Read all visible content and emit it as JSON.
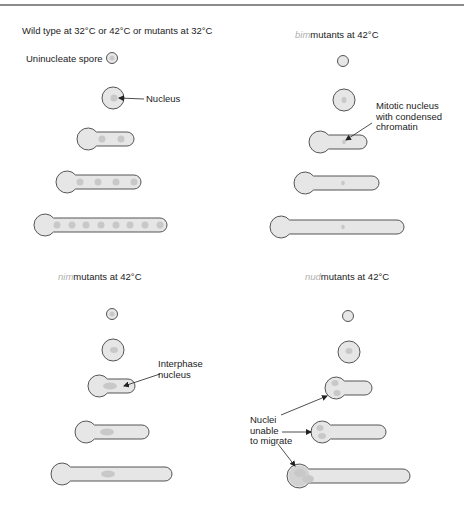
{
  "colors": {
    "outline": "#555555",
    "cell_fill": "#e6e6e6",
    "nucleus_fill": "#c8c8c8",
    "text": "#222222",
    "prefix_text": "#b0b0b0",
    "divider": "#666666"
  },
  "panels": [
    {
      "id": "wild-type",
      "title": {
        "prefix": "",
        "text": "Wild type at 32°C or 42°C or mutants at 32°C",
        "x": 22,
        "y": 34
      },
      "cells": [
        {
          "type": "spore",
          "cx": 112,
          "cy": 58,
          "r": 5.5,
          "nuclei": [
            {
              "cx": 112,
              "cy": 58,
              "rx": 2.5,
              "ry": 2.5
            }
          ]
        },
        {
          "type": "spore",
          "cx": 113,
          "cy": 98,
          "r": 11,
          "nuclei": [
            {
              "cx": 114,
              "cy": 98,
              "rx": 3.5,
              "ry": 3.5
            }
          ]
        },
        {
          "type": "hypha",
          "x1": 88,
          "x2": 134,
          "cy": 139,
          "r": 11,
          "tube": 7,
          "nuclei": [
            {
              "cx": 102,
              "cy": 139,
              "rx": 3.5,
              "ry": 3.5
            },
            {
              "cx": 121,
              "cy": 139,
              "rx": 3.5,
              "ry": 3.5
            }
          ]
        },
        {
          "type": "hypha",
          "x1": 67,
          "x2": 141,
          "cy": 182,
          "r": 11,
          "tube": 7,
          "nuclei": [
            {
              "cx": 80,
              "cy": 182,
              "rx": 3.5,
              "ry": 3.5
            },
            {
              "cx": 98,
              "cy": 182,
              "rx": 3.5,
              "ry": 3.5
            },
            {
              "cx": 116,
              "cy": 182,
              "rx": 3.5,
              "ry": 3.5
            },
            {
              "cx": 134,
              "cy": 182,
              "rx": 3.5,
              "ry": 3.5
            }
          ]
        },
        {
          "type": "hypha",
          "x1": 45,
          "x2": 167,
          "cy": 225,
          "r": 11,
          "tube": 7,
          "nuclei": [
            {
              "cx": 57,
              "cy": 225,
              "rx": 3.5,
              "ry": 3.5
            },
            {
              "cx": 72,
              "cy": 225,
              "rx": 3.5,
              "ry": 3.5
            },
            {
              "cx": 86,
              "cy": 225,
              "rx": 3.5,
              "ry": 3.5
            },
            {
              "cx": 101,
              "cy": 225,
              "rx": 3.5,
              "ry": 3.5
            },
            {
              "cx": 116,
              "cy": 225,
              "rx": 3.5,
              "ry": 3.5
            },
            {
              "cx": 130,
              "cy": 225,
              "rx": 3.5,
              "ry": 3.5
            },
            {
              "cx": 145,
              "cy": 225,
              "rx": 3.5,
              "ry": 3.5
            },
            {
              "cx": 160,
              "cy": 225,
              "rx": 3.5,
              "ry": 3.5
            }
          ]
        }
      ],
      "labels": [
        {
          "lines": [
            "Uninucleate spore"
          ],
          "x": 26,
          "y": 62
        },
        {
          "lines": [
            "Nucleus"
          ],
          "x": 146,
          "y": 102
        }
      ],
      "arrows": [
        {
          "x1": 144,
          "y1": 99,
          "x2": 119,
          "y2": 98
        }
      ]
    },
    {
      "id": "bim",
      "title": {
        "prefix": "bim",
        "text": "mutants at 42°C",
        "x": 295,
        "y": 38
      },
      "cells": [
        {
          "type": "spore",
          "cx": 343,
          "cy": 61,
          "r": 5.5,
          "nuclei": []
        },
        {
          "type": "spore",
          "cx": 344,
          "cy": 100,
          "r": 11,
          "nuclei": [
            {
              "cx": 344,
              "cy": 100,
              "rx": 2.5,
              "ry": 3
            }
          ]
        },
        {
          "type": "hypha",
          "x1": 320,
          "x2": 367,
          "cy": 142,
          "r": 11,
          "tube": 7,
          "nuclei": [
            {
              "cx": 344,
              "cy": 142,
              "rx": 1.8,
              "ry": 2.2
            }
          ]
        },
        {
          "type": "hypha",
          "x1": 305,
          "x2": 379,
          "cy": 183,
          "r": 11,
          "tube": 7,
          "nuclei": [
            {
              "cx": 343,
              "cy": 183,
              "rx": 1.8,
              "ry": 2.2
            }
          ]
        },
        {
          "type": "hypha",
          "x1": 281,
          "x2": 404,
          "cy": 227,
          "r": 11,
          "tube": 7,
          "nuclei": [
            {
              "cx": 343,
              "cy": 227,
              "rx": 1.8,
              "ry": 2.2
            }
          ]
        }
      ],
      "labels": [
        {
          "lines": [
            "Mitotic nucleus",
            "with condensed",
            "chromatin"
          ],
          "x": 376,
          "y": 109
        }
      ],
      "arrows": [
        {
          "x1": 372,
          "y1": 123,
          "x2": 346,
          "y2": 140
        }
      ]
    },
    {
      "id": "nim",
      "title": {
        "prefix": "nim",
        "text": "mutants at 42°C",
        "x": 58,
        "y": 280
      },
      "cells": [
        {
          "type": "spore",
          "cx": 112,
          "cy": 314,
          "r": 5.5,
          "nuclei": [
            {
              "cx": 112,
              "cy": 314,
              "rx": 2.5,
              "ry": 2.5
            }
          ]
        },
        {
          "type": "spore",
          "cx": 113,
          "cy": 350,
          "r": 11,
          "nuclei": [
            {
              "cx": 114,
              "cy": 350,
              "rx": 4,
              "ry": 3
            }
          ]
        },
        {
          "type": "hypha",
          "x1": 99,
          "x2": 135,
          "cy": 386,
          "r": 11,
          "tube": 7,
          "nuclei": [
            {
              "cx": 110,
              "cy": 386,
              "rx": 7,
              "ry": 3.5
            }
          ]
        },
        {
          "type": "hypha",
          "x1": 86,
          "x2": 149,
          "cy": 432,
          "r": 11,
          "tube": 7,
          "nuclei": [
            {
              "cx": 107,
              "cy": 432,
              "rx": 7,
              "ry": 3.5
            }
          ]
        },
        {
          "type": "hypha",
          "x1": 62,
          "x2": 172,
          "cy": 474,
          "r": 11,
          "tube": 7,
          "nuclei": [
            {
              "cx": 108,
              "cy": 474,
              "rx": 7,
              "ry": 3.5
            }
          ]
        }
      ],
      "labels": [
        {
          "lines": [
            "Interphase",
            "nucleus"
          ],
          "x": 158,
          "y": 367
        }
      ],
      "arrows": [
        {
          "x1": 160,
          "y1": 374,
          "x2": 124,
          "y2": 386
        }
      ]
    },
    {
      "id": "nud",
      "title": {
        "prefix": "nud",
        "text": "mutants at 42°C",
        "x": 305,
        "y": 280
      },
      "cells": [
        {
          "type": "spore",
          "cx": 348,
          "cy": 316,
          "r": 5.5,
          "nuclei": []
        },
        {
          "type": "spore",
          "cx": 349,
          "cy": 352,
          "r": 11,
          "nuclei": [
            {
              "cx": 349,
              "cy": 351,
              "rx": 3.5,
              "ry": 3
            }
          ]
        },
        {
          "type": "hypha",
          "x1": 336,
          "x2": 372,
          "cy": 388,
          "r": 11,
          "tube": 7,
          "nuclei": [
            {
              "cx": 335,
              "cy": 383,
              "rx": 3.5,
              "ry": 3
            },
            {
              "cx": 337,
              "cy": 393,
              "rx": 3.5,
              "ry": 3
            }
          ]
        },
        {
          "type": "hypha",
          "x1": 322,
          "x2": 386,
          "cy": 432,
          "r": 11,
          "tube": 7,
          "nuclei": [
            {
              "cx": 320,
              "cy": 428,
              "rx": 3.5,
              "ry": 3
            },
            {
              "cx": 322,
              "cy": 436,
              "rx": 4,
              "ry": 3
            }
          ]
        },
        {
          "type": "hypha",
          "x1": 299,
          "x2": 410,
          "cy": 476,
          "r": 12,
          "tube": 7,
          "shaded_head": true,
          "nuclei": [
            {
              "cx": 300,
              "cy": 473,
              "rx": 6,
              "ry": 4
            },
            {
              "cx": 308,
              "cy": 479,
              "rx": 6,
              "ry": 4
            }
          ]
        }
      ],
      "labels": [
        {
          "lines": [
            "Nuclei",
            "unable",
            "to migrate"
          ],
          "x": 250,
          "y": 423
        }
      ],
      "arrows": [
        {
          "x1": 281,
          "y1": 415,
          "x2": 327,
          "y2": 396
        },
        {
          "x1": 282,
          "y1": 432,
          "x2": 311,
          "y2": 432
        },
        {
          "x1": 278,
          "y1": 444,
          "x2": 295,
          "y2": 466
        }
      ]
    }
  ]
}
